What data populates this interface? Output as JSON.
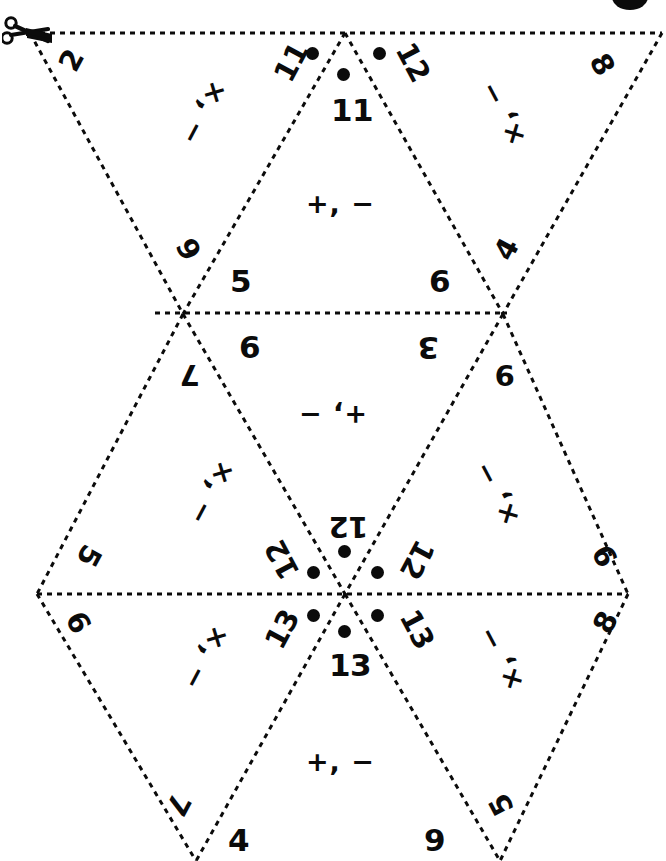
{
  "document": {
    "title": "Flexagon Fold-and-Cut Template",
    "kind": "printable-craft-template",
    "page_size_px": [
      666,
      861
    ],
    "ink_color": "#0b0b0b",
    "paper_color": "#ffffff"
  },
  "icons": {
    "cut_here": "scissors-icon"
  },
  "lines": {
    "style": "dashed",
    "dash": "5 5",
    "stroke_width": 3,
    "color": "#0b0b0b",
    "note": "dashed fold/cut guides forming a strip of equilateral triangles"
  },
  "numbers": {
    "top_row": [
      {
        "id": "n-2",
        "text": "2",
        "rot": -62
      },
      {
        "id": "n-11-l",
        "text": "11",
        "rot": -62,
        "dot": true
      },
      {
        "id": "n-11-c",
        "text": "11",
        "rot": 0,
        "dot": true
      },
      {
        "id": "n-12-r",
        "text": "12",
        "rot": 62,
        "dot": true
      },
      {
        "id": "n-8-tr",
        "text": "8",
        "rot": 62
      }
    ],
    "upper_mid_row": [
      {
        "id": "n-9-l",
        "text": "9",
        "rot": 62
      },
      {
        "id": "n-5",
        "text": "5",
        "rot": 0
      },
      {
        "id": "n-6-ur",
        "text": "6",
        "rot": 0
      },
      {
        "id": "n-4",
        "text": "4",
        "rot": -62
      }
    ],
    "lower_mid_row": [
      {
        "id": "n-7",
        "text": "7",
        "rot": 180
      },
      {
        "id": "n-6-ml",
        "text": "6",
        "rot": 0
      },
      {
        "id": "n-3",
        "text": "3",
        "rot": 180
      },
      {
        "id": "n-9-mr",
        "text": "9",
        "rot": 180
      }
    ],
    "center_rosette": [
      {
        "id": "n-12-top",
        "text": "12",
        "rot": 180,
        "dot": true
      },
      {
        "id": "n-12-left",
        "text": "12",
        "rot": 242,
        "dot": true
      },
      {
        "id": "n-12-right",
        "text": "12",
        "rot": 118,
        "dot": true
      },
      {
        "id": "n-13-left",
        "text": "13",
        "rot": 298,
        "dot": true
      },
      {
        "id": "n-13-right",
        "text": "13",
        "rot": 62,
        "dot": true
      },
      {
        "id": "n-13-bot",
        "text": "13",
        "rot": 0,
        "dot": true
      }
    ],
    "left_vertex": [
      {
        "id": "n-5-lv",
        "text": "5",
        "rot": 118
      },
      {
        "id": "n-6-lv",
        "text": "6",
        "rot": 62
      }
    ],
    "right_vertex": [
      {
        "id": "n-9-rv",
        "text": "9",
        "rot": 242
      },
      {
        "id": "n-8-rv",
        "text": "8",
        "rot": 298
      }
    ],
    "bottom_row": [
      {
        "id": "n-7-b",
        "text": "7",
        "rot": 118
      },
      {
        "id": "n-4-b",
        "text": "4",
        "rot": 0
      },
      {
        "id": "n-9-b",
        "text": "9",
        "rot": 0
      },
      {
        "id": "n-5-b",
        "text": "5",
        "rot": 242
      }
    ]
  },
  "operators": {
    "plus_minus": "+, −",
    "times_minus": "×, −",
    "cells": [
      {
        "id": "op-top-left",
        "text": "×, −",
        "rot": 118
      },
      {
        "id": "op-top-center",
        "text": "+, −",
        "rot": 0
      },
      {
        "id": "op-top-right",
        "text": "×, −",
        "rot": 242
      },
      {
        "id": "op-mid-center",
        "text": "+, −",
        "rot": 180
      },
      {
        "id": "op-mid-left",
        "text": "×, −",
        "rot": 118
      },
      {
        "id": "op-mid-right",
        "text": "×, −",
        "rot": 242
      },
      {
        "id": "op-bot-left",
        "text": "×, −",
        "rot": 118
      },
      {
        "id": "op-bot-center",
        "text": "+, −",
        "rot": 0
      },
      {
        "id": "op-bot-right",
        "text": "×, −",
        "rot": 242
      }
    ]
  }
}
